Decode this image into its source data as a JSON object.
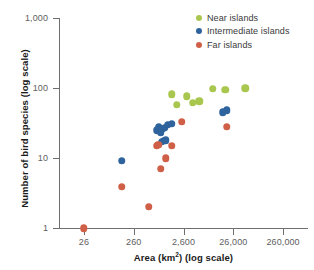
{
  "chart_data": {
    "type": "scatter",
    "title": "",
    "xlabel": "Area (km²) (log scale)",
    "xlabel_main": "Area (km",
    "xlabel_sup": "2",
    "xlabel_tail": ") (log scale)",
    "ylabel": "Number of bird species (log scale)",
    "xscale": "log",
    "yscale": "log",
    "xlim": [
      8.2,
      822000
    ],
    "ylim": [
      1,
      1000
    ],
    "grid": false,
    "xticks": [
      26,
      260,
      2600,
      26000,
      260000
    ],
    "xtick_labels": [
      "26",
      "260",
      "2,600",
      "26,000",
      "260,000"
    ],
    "yticks": [
      1,
      10,
      100,
      1000
    ],
    "ytick_labels": [
      "1",
      "10",
      "100",
      "1,000"
    ],
    "legend_position": "top-right",
    "series": [
      {
        "name": "Near islands",
        "color": "#a9c74e",
        "points": [
          [
            1500,
            82
          ],
          [
            1900,
            58
          ],
          [
            3000,
            76
          ],
          [
            4000,
            62
          ],
          [
            5400,
            65
          ],
          [
            10000,
            98
          ],
          [
            18000,
            95
          ],
          [
            45000,
            99
          ]
        ]
      },
      {
        "name": "Intermediate islands",
        "color": "#2f639d",
        "points": [
          [
            150,
            9.2
          ],
          [
            780,
            25
          ],
          [
            820,
            28
          ],
          [
            900,
            23
          ],
          [
            1000,
            26
          ],
          [
            1100,
            27
          ],
          [
            1250,
            30
          ],
          [
            1500,
            31
          ],
          [
            950,
            17
          ],
          [
            1050,
            17.5
          ],
          [
            1150,
            18
          ],
          [
            16000,
            45
          ],
          [
            19000,
            48
          ]
        ]
      },
      {
        "name": "Far islands",
        "color": "#d05f47",
        "points": [
          [
            26,
            1
          ],
          [
            150,
            3.9
          ],
          [
            520,
            2
          ],
          [
            760,
            15
          ],
          [
            800,
            15.5
          ],
          [
            900,
            7
          ],
          [
            1150,
            10
          ],
          [
            1500,
            15
          ],
          [
            2400,
            33
          ],
          [
            19000,
            28
          ]
        ]
      }
    ]
  },
  "legend": {
    "items": [
      {
        "label": "Near islands",
        "color": "#a9c74e"
      },
      {
        "label": "Intermediate islands",
        "color": "#2f639d"
      },
      {
        "label": "Far islands",
        "color": "#d05f47"
      }
    ]
  }
}
